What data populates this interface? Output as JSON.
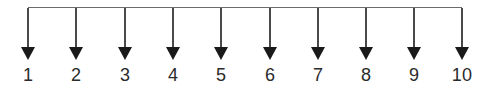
{
  "figure": {
    "title": "",
    "background_color": "#ffffff",
    "width": 497,
    "height": 94
  },
  "chart_data": {
    "type": "diagram",
    "title": "",
    "subtitle": "",
    "xlabel": "",
    "ylabel": "",
    "categories": [
      "1",
      "2",
      "3",
      "4",
      "5",
      "6",
      "7",
      "8",
      "9",
      "10"
    ],
    "values": [
      1,
      2,
      3,
      4,
      5,
      6,
      7,
      8,
      9,
      10
    ],
    "legend": [],
    "grid": false,
    "annotations": []
  },
  "busline": {
    "orientation": "horizontal",
    "start_x": 28,
    "end_x": 462,
    "y": 7.5,
    "stroke_color": "#6b6b6b",
    "stroke_width": 1.2
  },
  "arrow_style": {
    "stem_color": "#4a4a4a",
    "stem_width": 1.6,
    "head_color": "#1a1a1a",
    "head_width": 14,
    "head_height": 13,
    "stem_top_y": 7.5,
    "head_top_y": 47,
    "tip_y": 60
  },
  "arrows": [
    {
      "index": 1,
      "label": "1",
      "x": 28,
      "label_y": 66
    },
    {
      "index": 2,
      "label": "2",
      "x": 76,
      "label_y": 66
    },
    {
      "index": 3,
      "label": "3",
      "x": 125,
      "label_y": 66
    },
    {
      "index": 4,
      "label": "4",
      "x": 173,
      "label_y": 66
    },
    {
      "index": 5,
      "label": "5",
      "x": 221,
      "label_y": 66
    },
    {
      "index": 6,
      "label": "6",
      "x": 270,
      "label_y": 66
    },
    {
      "index": 7,
      "label": "7",
      "x": 318,
      "label_y": 66
    },
    {
      "index": 8,
      "label": "8",
      "x": 366,
      "label_y": 66
    },
    {
      "index": 9,
      "label": "9",
      "x": 414,
      "label_y": 66
    },
    {
      "index": 10,
      "label": "10",
      "x": 462,
      "label_y": 66
    }
  ]
}
